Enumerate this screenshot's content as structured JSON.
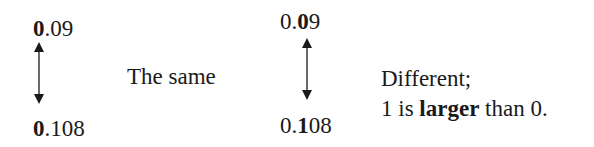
{
  "left_comparison": {
    "top_number": {
      "bold_part": "0",
      "rest": ".09"
    },
    "bottom_number": {
      "bold_part": "0",
      "rest": ".108"
    },
    "arrow_icon": "double-headed-vertical-arrow",
    "result_label": "The same"
  },
  "right_comparison": {
    "top_number": {
      "prefix": "0.",
      "bold_part": "0",
      "rest": "9"
    },
    "bottom_number": {
      "prefix": "0.",
      "bold_part": "1",
      "rest": "08"
    },
    "arrow_icon": "double-headed-vertical-arrow",
    "result_label_line1": "Different;",
    "result_label_line2": {
      "before": "1 is ",
      "bold": "larger",
      "after": " than 0."
    }
  },
  "colors": {
    "text": "#1a1a1a",
    "background": "#ffffff"
  }
}
